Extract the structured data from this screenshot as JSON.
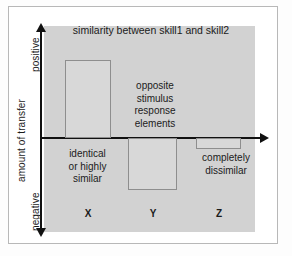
{
  "chart_data": {
    "type": "bar",
    "title": "similarity between skill1 and skill2",
    "xlabel": "similarity between skill1 and skill2",
    "ylabel": "amount of transfer",
    "categories": [
      "X",
      "Y",
      "Z"
    ],
    "values": [
      78,
      -52,
      -11
    ],
    "ylim": [
      -100,
      100
    ],
    "grid": false,
    "legend": false,
    "axis_direction_labels": {
      "top": "positive",
      "bottom": "negative"
    },
    "annotations": [
      {
        "category": "X",
        "text": "identical or highly similar",
        "position": "below-axis"
      },
      {
        "category": "Y",
        "text": "opposite stimulus response elements",
        "position": "above-axis"
      },
      {
        "category": "Z",
        "text": "completely dissimilar",
        "position": "below-bar"
      }
    ]
  },
  "figure": {
    "title": "similarity between skill1 and skill2",
    "y_axis": {
      "positive_label": "positive",
      "axis_title": "amount of transfer",
      "negative_label": "negative"
    },
    "bars": {
      "x": {
        "category": "X",
        "annotation": "identical\nor highly\nsimilar"
      },
      "y": {
        "category": "Y",
        "annotation": "opposite\nstimulus\nresponse\nelements"
      },
      "z": {
        "category": "Z",
        "annotation": "completely\ndissimilar"
      }
    },
    "annotation_x_line1": "identical",
    "annotation_x_line2": "or highly",
    "annotation_x_line3": "similar",
    "annotation_y_line1": "opposite",
    "annotation_y_line2": "stimulus",
    "annotation_y_line3": "response",
    "annotation_y_line4": "elements",
    "annotation_z_line1": "completely",
    "annotation_z_line2": "dissimilar",
    "category_x": "X",
    "category_y": "Y",
    "category_z": "Z",
    "colors": {
      "panel_background": "#d2d2d2",
      "bar_fill": "#d8d8d8",
      "bar_stroke": "#8e8e8e",
      "axis": "#111111",
      "text": "#1b1b1b"
    }
  }
}
